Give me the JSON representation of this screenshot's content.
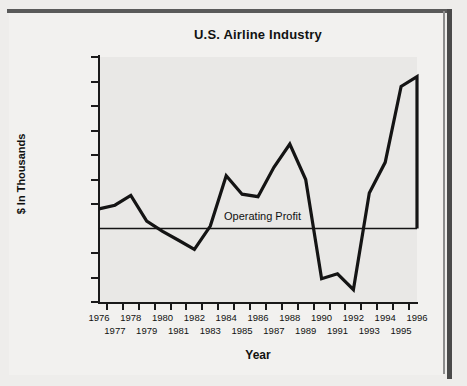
{
  "chart_data": {
    "type": "line",
    "title": "U.S. Airline Industry",
    "xlabel": "Year",
    "ylabel": "$ In Thousands",
    "series_name": "Operating Profit",
    "annotation": "Operating Profit",
    "grid": false,
    "legend": "none",
    "ylim": [
      -3000000,
      7000000
    ],
    "ytick_values": [
      7000000,
      6000000,
      5000000,
      4000000,
      3000000,
      2000000,
      1000000,
      0,
      -1000000,
      -2000000,
      -3000000
    ],
    "ytick_labels": [
      "7,000,000",
      "6,000,000",
      "5,000,000",
      "4,000,000",
      "3,000,000",
      "2,000,000",
      "1,000,000",
      "",
      "(1,000,000)",
      "(2,000,000)",
      "(3,000,000)"
    ],
    "categories": [
      1976,
      1977,
      1978,
      1979,
      1980,
      1981,
      1982,
      1983,
      1984,
      1985,
      1986,
      1987,
      1988,
      1989,
      1990,
      1991,
      1992,
      1993,
      1994,
      1995,
      1996
    ],
    "xtick_labels_top": [
      "1976",
      "",
      "1978",
      "",
      "1980",
      "",
      "1982",
      "",
      "1984",
      "",
      "1986",
      "",
      "1988",
      "",
      "1990",
      "",
      "1992",
      "",
      "1994",
      "",
      "1996"
    ],
    "xtick_labels_bottom": [
      "",
      "1977",
      "",
      "1979",
      "",
      "1981",
      "",
      "1983",
      "",
      "1985",
      "",
      "1987",
      "",
      "1989",
      "",
      "1991",
      "",
      "1993",
      "",
      "1995",
      ""
    ],
    "values": [
      800000,
      950000,
      1350000,
      300000,
      -120000,
      -480000,
      -850000,
      100000,
      2150000,
      1400000,
      1300000,
      2500000,
      3450000,
      2000000,
      -2050000,
      -1850000,
      -2500000,
      1450000,
      2700000,
      5800000,
      6200000
    ],
    "zero_reference_line": 0,
    "line_color": "#141414"
  },
  "style": {
    "plot_background": "#e9e8e6",
    "page_background": "#f2f1ef",
    "border_color": "#4a4a4a",
    "text_color": "#111111"
  }
}
